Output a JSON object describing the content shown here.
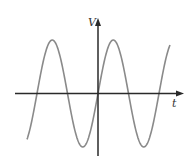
{
  "figure": {
    "type": "sine-wave-diagram",
    "y_axis_label": "V",
    "x_axis_label": "t",
    "colors": {
      "axis": "#2a2a2a",
      "wave": "#8a8a8a",
      "label": "#333333",
      "background": "#ffffff"
    }
  },
  "chart_data": {
    "type": "line",
    "title": "",
    "xlabel": "t",
    "ylabel": "V",
    "function": "V = sin(t)",
    "grid": false,
    "legend": null,
    "phase_at_origin_deg": 0,
    "x_range_periods": [
      -1.16,
      1.18
    ],
    "amplitude_normalized": 1
  },
  "layout": {
    "origin": [
      98,
      93.5
    ],
    "x_axis": {
      "x1": 15,
      "x2": 183
    },
    "y_axis": {
      "y1": 19,
      "y2": 156
    },
    "wave": {
      "x_start": 27,
      "x_end": 170,
      "amplitude_px": 53.5,
      "period_px": 61,
      "zero_x": 98
    },
    "label_v": [
      88,
      26
    ],
    "label_t": [
      172,
      107
    ]
  }
}
